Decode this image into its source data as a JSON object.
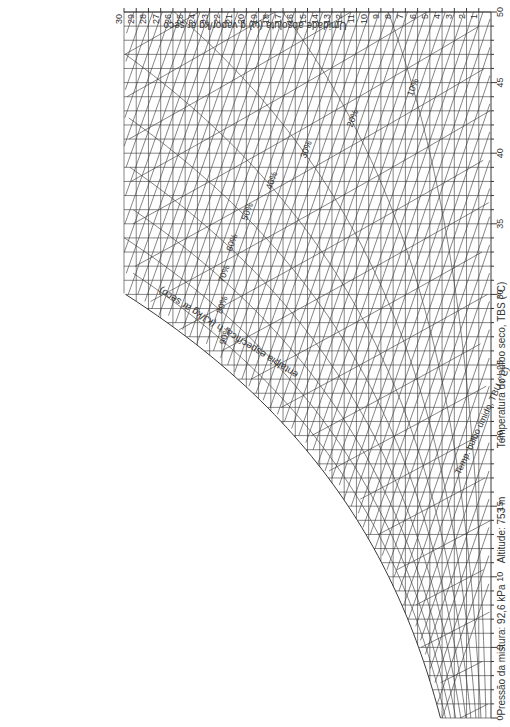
{
  "chart_data": {
    "type": "line",
    "orientation": "rotated 90° clockwise (temperature axis on right edge, vertical)",
    "xlabel": "Temperatura do bulbo seco, TBS (°C)",
    "ylabel": "Umidade absoluta (ω) g vapor/kg ar seco",
    "enthalpy_label": "entalpia específica, h (kJ/kg ar seco)",
    "wet_bulb_label": "Temp. bulbo úmido, TBU (°C)",
    "volume_label": "m³/kg ar seco",
    "pressure_note": "Pressão da mistura: 92,6 kPa",
    "altitude_note": "Altitude: 753 m",
    "x_ticks": [
      0,
      5,
      10,
      15,
      20,
      25,
      30,
      35,
      40,
      45,
      50
    ],
    "xlim": [
      0,
      50
    ],
    "y_ticks": [
      1,
      2,
      3,
      4,
      5,
      6,
      7,
      8,
      9,
      10,
      11,
      12,
      13,
      14,
      15,
      16,
      17,
      18,
      19,
      20,
      21,
      22,
      23,
      24,
      25,
      26,
      27,
      28,
      29,
      30
    ],
    "ylim": [
      0,
      30
    ],
    "relative_humidity_labels": [
      "10%",
      "20%",
      "30%",
      "40%",
      "50%",
      "60%",
      "70%",
      "80%",
      "90%"
    ],
    "specific_volume_labels": [
      "0.85",
      "0.86",
      "0.87",
      "0.88",
      "0.89",
      "0.9",
      "0.91",
      "0.92",
      "0.93",
      "0.94",
      "0.95",
      "0.96",
      "0.97",
      "0.98",
      "0.99",
      "1",
      "1.01",
      "1.02",
      "1.03",
      "1.04"
    ],
    "enthalpy_labels": [
      "10",
      "20",
      "30",
      "40",
      "50",
      "60",
      "70",
      "80",
      "90",
      "100",
      "110",
      "120"
    ],
    "grid": true
  },
  "notes": {
    "pressure": "Pressão da mistura: 92,6 kPa",
    "altitude": "Altitude: 753 m",
    "x_axis_title": "Temperatura do bulbo seco, TBS (°C)",
    "y_axis_title": "Umidade absoluta (ω) g vapor/kg ar seco",
    "enthalpy_title": "entalpia específica, h (kJ/kg ar seco)"
  }
}
